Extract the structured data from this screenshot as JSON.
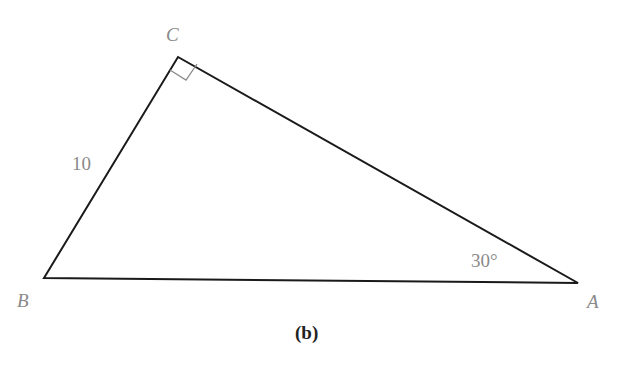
{
  "diagram": {
    "type": "right-triangle",
    "caption": "(b)",
    "vertices": {
      "A": {
        "label": "A",
        "x": 578,
        "y": 283
      },
      "B": {
        "label": "B",
        "x": 44,
        "y": 278
      },
      "C": {
        "label": "C",
        "x": 178,
        "y": 57
      }
    },
    "right_angle_at": "C",
    "side_labels": {
      "BC": "10"
    },
    "angle_labels": {
      "A": "30°"
    },
    "colors": {
      "edges": "#1a1a1a",
      "labels": "#8a8a8a",
      "right_angle_marker": "#8a8a8a",
      "caption": "#222222"
    }
  }
}
